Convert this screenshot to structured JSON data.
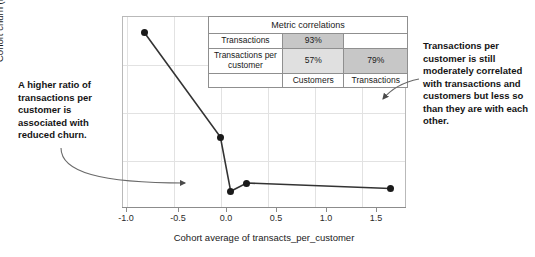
{
  "chart_data": {
    "type": "line",
    "title": "",
    "xlabel": "Cohort average of transacts_per_customer",
    "ylabel": "Cohort churn (relative)",
    "xlim": [
      -1.18,
      1.85
    ],
    "ylim": [
      -0.3,
      1.08
    ],
    "grid": true,
    "legend": "none",
    "xticks": [
      "-1.0",
      "-0.5",
      "0.0",
      "0.5",
      "1.0",
      "1.5"
    ],
    "xtick_values": [
      -1.0,
      -0.5,
      0.0,
      0.5,
      1.0,
      1.5
    ],
    "yticks": [],
    "series": [
      {
        "name": "Cohort churn (relative)",
        "marker": "filled-circle",
        "color": "#1a1a1a",
        "x": [
          -0.94,
          -0.13,
          -0.02,
          0.15,
          1.68
        ],
        "y": [
          0.96,
          0.21,
          -0.18,
          -0.12,
          -0.16
        ]
      }
    ],
    "annotations": [
      {
        "name": "left-callout",
        "text": "A higher ratio of transactions per customer is associated with reduced churn.",
        "points_to": "low-churn-plateau"
      },
      {
        "name": "right-callout",
        "text": "Transactions per customer is still moderately correlated with transactions and customers but less so than they are with each other.",
        "points_to": "metric-correlations-table"
      }
    ]
  },
  "annotations": {
    "left": "A higher ratio of transactions per customer is associated with reduced churn.",
    "right": "Transactions per customer is still moderately correlated with transactions and customers but less so than they are with each other."
  },
  "axes": {
    "x_title": "Cohort average of transacts_per_customer",
    "y_title": "Cohort churn (relative)",
    "x_tick_labels": [
      "-1.0",
      "-0.5",
      "0.0",
      "0.5",
      "1.0",
      "1.5"
    ]
  },
  "table": {
    "title": "Metric correlations",
    "rows": [
      {
        "label": "Transactions",
        "customers": "93%",
        "transactions": ""
      },
      {
        "label": "Transactions per customer",
        "customers": "57%",
        "transactions": "79%"
      }
    ],
    "footer": {
      "label": "",
      "customers": "Customers",
      "transactions": "Transactions"
    }
  },
  "colors": {
    "marker": "#1a1a1a",
    "line": "#333333",
    "grid": "#e2e2e2",
    "frame": "#b9b9b9",
    "shade_dark": "#c7c7c7",
    "shade_light": "#e0e0e0"
  }
}
